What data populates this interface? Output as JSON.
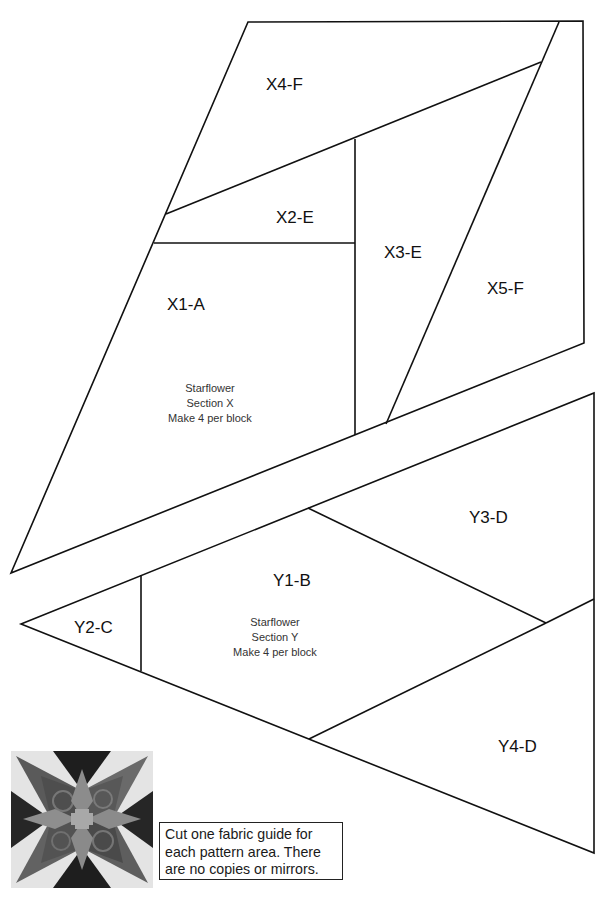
{
  "section_x": {
    "name": "Starflower",
    "section": "Section X",
    "instruction": "Make 4 per block",
    "pieces": [
      {
        "id": "X1-A",
        "label": "X1-A"
      },
      {
        "id": "X2-E",
        "label": "X2-E"
      },
      {
        "id": "X3-E",
        "label": "X3-E"
      },
      {
        "id": "X4-F",
        "label": "X4-F"
      },
      {
        "id": "X5-F",
        "label": "X5-F"
      }
    ]
  },
  "section_y": {
    "name": "Starflower",
    "section": "Section Y",
    "instruction": "Make 4 per block",
    "pieces": [
      {
        "id": "Y1-B",
        "label": "Y1-B"
      },
      {
        "id": "Y2-C",
        "label": "Y2-C"
      },
      {
        "id": "Y3-D",
        "label": "Y3-D"
      },
      {
        "id": "Y4-D",
        "label": "Y4-D"
      }
    ]
  },
  "note": {
    "lines": [
      "Cut one fabric guide for",
      "each pattern area. There",
      "are no copies or mirrors."
    ]
  },
  "preview_image": {
    "subject": "Starflower quilt block preview (grayscale)"
  },
  "colors": {
    "line": "#111111",
    "background": "#ffffff",
    "text": "#111111"
  }
}
